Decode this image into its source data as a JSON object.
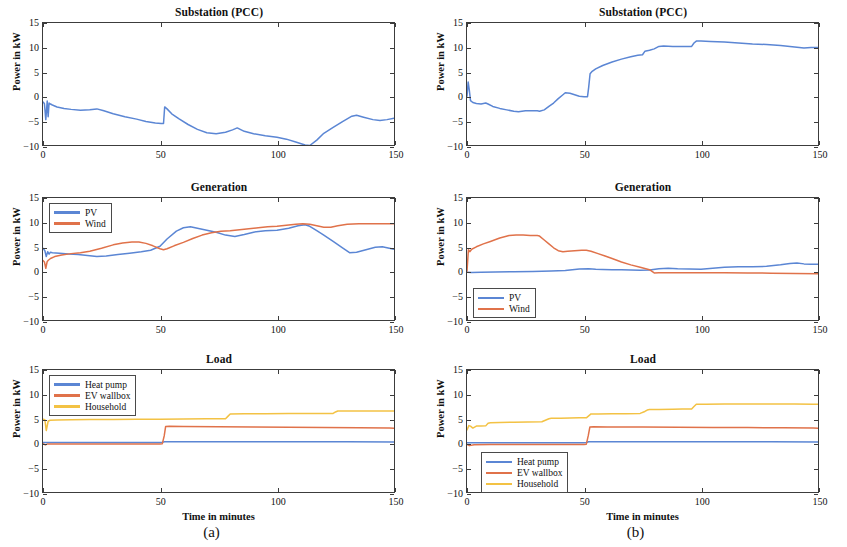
{
  "figure": {
    "width": 847,
    "height": 547,
    "colors": {
      "pv_blue": "#5B86D4",
      "wind_orange": "#E0724A",
      "household_yellow": "#F3C244",
      "axis": "#3c3c3c",
      "text": "#111111"
    },
    "panels": [
      {
        "id": "a",
        "caption": "(a)"
      },
      {
        "id": "b",
        "caption": "(b)"
      }
    ]
  },
  "chart_data": [
    {
      "id": "a-substation",
      "panel": "(a)",
      "type": "line",
      "title": "Substation (PCC)",
      "xlabel": "",
      "ylabel": "Power in kW",
      "xlim": [
        0,
        150
      ],
      "ylim": [
        -10,
        15
      ],
      "xticks": [
        0,
        50,
        100,
        150
      ],
      "yticks": [
        -10,
        -5,
        0,
        5,
        10,
        15
      ],
      "grid": false,
      "legend": null,
      "series": [
        {
          "name": "Substation power",
          "color": "#5B86D4",
          "x": [
            0,
            0.6,
            1.2,
            1.8,
            2.2,
            2.6,
            3.2,
            4,
            6,
            9,
            12,
            16,
            20,
            23,
            26,
            30,
            35,
            40,
            44,
            48,
            50.5,
            51.5,
            52,
            53,
            55,
            58,
            62,
            66,
            70,
            74,
            78,
            81,
            83,
            86,
            90,
            95,
            100,
            104,
            108,
            112,
            114,
            117,
            120,
            124,
            128,
            132,
            134,
            137,
            141,
            144,
            147,
            150
          ],
          "y": [
            -1.2,
            -1.5,
            -4.8,
            -1.0,
            -4.2,
            -1.4,
            -1.6,
            -1.8,
            -2.2,
            -2.5,
            -2.7,
            -2.9,
            -2.8,
            -2.6,
            -3.0,
            -3.6,
            -4.2,
            -4.7,
            -5.2,
            -5.5,
            -5.6,
            -5.6,
            -2.2,
            -2.6,
            -3.6,
            -4.6,
            -5.8,
            -6.8,
            -7.5,
            -7.7,
            -7.4,
            -6.9,
            -6.5,
            -7.2,
            -7.7,
            -8.1,
            -8.4,
            -8.8,
            -9.4,
            -10.0,
            -10.1,
            -9.0,
            -7.6,
            -6.4,
            -5.2,
            -4.1,
            -3.9,
            -4.3,
            -4.8,
            -5.0,
            -4.8,
            -4.5
          ]
        }
      ]
    },
    {
      "id": "a-generation",
      "panel": "(a)",
      "type": "line",
      "title": "Generation",
      "xlabel": "",
      "ylabel": "Power in kW",
      "xlim": [
        0,
        150
      ],
      "ylim": [
        -10,
        15
      ],
      "xticks": [
        0,
        50,
        100,
        150
      ],
      "yticks": [
        -10,
        -5,
        0,
        5,
        10,
        15
      ],
      "grid": false,
      "legend": {
        "position": "north-west",
        "entries": [
          "PV",
          "Wind"
        ]
      },
      "series": [
        {
          "name": "PV",
          "color": "#5B86D4",
          "x": [
            0,
            0.8,
            1.4,
            2,
            2.6,
            3.2,
            4,
            7,
            11,
            15,
            19,
            23,
            27,
            32,
            37,
            42,
            46,
            50,
            53,
            57,
            60,
            63,
            66,
            70,
            74,
            78,
            82,
            86,
            90,
            95,
            100,
            105,
            109,
            112,
            114,
            117,
            120,
            124,
            128,
            131,
            134,
            138,
            142,
            145,
            148,
            150
          ],
          "y": [
            4.7,
            4.2,
            3.0,
            4.0,
            3.5,
            3.9,
            3.8,
            3.7,
            3.5,
            3.4,
            3.2,
            3.0,
            3.1,
            3.4,
            3.7,
            4.0,
            4.3,
            5.1,
            6.6,
            8.2,
            8.9,
            9.1,
            8.8,
            8.4,
            8.0,
            7.4,
            7.1,
            7.5,
            8.0,
            8.3,
            8.4,
            8.8,
            9.3,
            9.5,
            9.2,
            8.3,
            7.4,
            6.1,
            4.8,
            3.8,
            3.9,
            4.4,
            4.9,
            5.0,
            4.7,
            4.5
          ]
        },
        {
          "name": "Wind",
          "color": "#E0724A",
          "x": [
            0,
            0.6,
            1.2,
            1.8,
            2.4,
            3.2,
            5,
            8,
            12,
            16,
            20,
            25,
            30,
            34,
            38,
            41,
            44,
            47,
            50,
            51.5,
            53,
            56,
            60,
            64,
            68,
            72,
            76,
            80,
            84,
            88,
            92,
            96,
            100,
            104,
            108,
            111,
            114,
            117,
            120,
            123,
            126,
            130,
            135,
            140,
            145,
            150
          ],
          "y": [
            2.2,
            1.9,
            0.6,
            2.0,
            2.3,
            2.6,
            3.0,
            3.3,
            3.6,
            3.8,
            4.1,
            4.7,
            5.4,
            5.8,
            6.0,
            6.0,
            5.7,
            5.2,
            4.6,
            4.4,
            4.6,
            5.2,
            5.9,
            6.7,
            7.4,
            7.9,
            8.2,
            8.3,
            8.5,
            8.7,
            8.9,
            9.1,
            9.2,
            9.4,
            9.6,
            9.7,
            9.6,
            9.3,
            9.0,
            9.0,
            9.3,
            9.6,
            9.7,
            9.7,
            9.7,
            9.7
          ]
        }
      ]
    },
    {
      "id": "a-load",
      "panel": "(a)",
      "type": "line",
      "title": "Load",
      "xlabel": "Time in minutes",
      "ylabel": "Power in kW",
      "xlim": [
        0,
        150
      ],
      "ylim": [
        -10,
        15
      ],
      "xticks": [
        0,
        50,
        100,
        150
      ],
      "yticks": [
        -10,
        -5,
        0,
        5,
        10,
        15
      ],
      "grid": false,
      "legend": {
        "position": "north-west",
        "entries": [
          "Heat pump",
          "EV wallbox",
          "Household"
        ]
      },
      "series": [
        {
          "name": "Heat pump",
          "color": "#5B86D4",
          "x": [
            0,
            2,
            5,
            20,
            40,
            50,
            51,
            52,
            55,
            70,
            90,
            110,
            130,
            150
          ],
          "y": [
            0.15,
            0.15,
            0.15,
            0.15,
            0.15,
            0.15,
            0.2,
            0.3,
            0.3,
            0.3,
            0.3,
            0.3,
            0.3,
            0.25
          ]
        },
        {
          "name": "EV wallbox",
          "color": "#E0724A",
          "x": [
            0,
            1,
            2,
            5,
            15,
            30,
            45,
            50,
            51,
            51.8,
            52.4,
            54,
            60,
            75,
            90,
            105,
            120,
            135,
            148,
            150
          ],
          "y": [
            -0.1,
            -0.35,
            -0.15,
            -0.15,
            -0.15,
            -0.15,
            -0.15,
            -0.15,
            -0.1,
            1.5,
            3.4,
            3.45,
            3.4,
            3.35,
            3.3,
            3.25,
            3.2,
            3.15,
            3.1,
            3.05
          ]
        },
        {
          "name": "Household",
          "color": "#F3C244",
          "x": [
            0,
            0.8,
            1.4,
            2.2,
            3,
            6,
            12,
            20,
            30,
            40,
            50,
            60,
            70,
            78,
            79,
            80,
            86,
            95,
            105,
            115,
            124,
            125,
            126,
            132,
            140,
            148,
            150
          ],
          "y": [
            4.9,
            4.8,
            2.6,
            4.5,
            4.7,
            4.75,
            4.8,
            4.85,
            4.85,
            4.9,
            4.9,
            4.95,
            5.0,
            5.0,
            5.5,
            6.0,
            6.05,
            6.05,
            6.1,
            6.1,
            6.1,
            6.4,
            6.6,
            6.6,
            6.6,
            6.6,
            6.6
          ]
        }
      ]
    },
    {
      "id": "b-substation",
      "panel": "(b)",
      "type": "line",
      "title": "Substation (PCC)",
      "xlabel": "",
      "ylabel": "Power in kW",
      "xlim": [
        0,
        150
      ],
      "ylim": [
        -10,
        15
      ],
      "xticks": [
        0,
        50,
        100,
        150
      ],
      "yticks": [
        -10,
        -5,
        0,
        5,
        10,
        15
      ],
      "grid": false,
      "legend": null,
      "series": [
        {
          "name": "Substation power",
          "color": "#5B86D4",
          "x": [
            0,
            0.5,
            1,
            1.5,
            2.5,
            4,
            6,
            8,
            9,
            11,
            14,
            17,
            20,
            22,
            25,
            28,
            30,
            31,
            33,
            35,
            37,
            39,
            41,
            42,
            44,
            46,
            48,
            50,
            51.5,
            52,
            52.6,
            53.5,
            55,
            58,
            62,
            66,
            70,
            73,
            75,
            76,
            78,
            80,
            82,
            84,
            88,
            92,
            96,
            97,
            98,
            100,
            104,
            110,
            116,
            122,
            128,
            134,
            140,
            144,
            147,
            150
          ],
          "y": [
            0.0,
            2.9,
            1.2,
            -0.9,
            -1.3,
            -1.5,
            -1.6,
            -1.4,
            -1.6,
            -2.1,
            -2.5,
            -2.8,
            -3.1,
            -3.2,
            -3.0,
            -3.0,
            -3.0,
            -3.1,
            -2.8,
            -2.1,
            -1.4,
            -0.5,
            0.3,
            0.7,
            0.6,
            0.3,
            0.0,
            -0.1,
            -0.1,
            1.8,
            4.6,
            5.1,
            5.6,
            6.3,
            7.0,
            7.6,
            8.1,
            8.4,
            8.5,
            9.2,
            9.4,
            9.7,
            10.2,
            10.3,
            10.2,
            10.2,
            10.2,
            10.9,
            11.3,
            11.3,
            11.2,
            11.1,
            10.9,
            10.7,
            10.6,
            10.4,
            10.1,
            9.9,
            10.0,
            10.0
          ]
        }
      ]
    },
    {
      "id": "b-generation",
      "panel": "(b)",
      "type": "line",
      "title": "Generation",
      "xlabel": "",
      "ylabel": "Power in kW",
      "xlim": [
        0,
        150
      ],
      "ylim": [
        -10,
        15
      ],
      "xticks": [
        0,
        50,
        100,
        150
      ],
      "yticks": [
        -10,
        -5,
        0,
        5,
        10,
        15
      ],
      "grid": false,
      "legend": {
        "position": "south-west",
        "entries": [
          "PV",
          "Wind"
        ]
      },
      "series": [
        {
          "name": "PV",
          "color": "#5B86D4",
          "x": [
            0,
            2,
            6,
            12,
            20,
            28,
            36,
            42,
            48,
            52,
            55,
            58,
            62,
            66,
            70,
            74,
            78,
            82,
            86,
            90,
            95,
            100,
            105,
            110,
            116,
            122,
            128,
            134,
            138,
            141,
            144,
            147,
            150
          ],
          "y": [
            -0.2,
            -0.25,
            -0.2,
            -0.15,
            -0.1,
            -0.05,
            0.05,
            0.15,
            0.45,
            0.5,
            0.4,
            0.35,
            0.3,
            0.3,
            0.25,
            0.2,
            0.25,
            0.5,
            0.6,
            0.5,
            0.45,
            0.4,
            0.6,
            0.8,
            0.9,
            0.9,
            1.0,
            1.3,
            1.6,
            1.7,
            1.5,
            1.4,
            1.4
          ]
        },
        {
          "name": "Wind",
          "color": "#E0724A",
          "x": [
            0,
            0.6,
            1.2,
            2,
            4,
            7,
            10,
            14,
            18,
            21,
            24,
            27,
            30,
            31,
            33,
            35,
            37,
            39,
            41,
            43,
            46,
            49,
            51,
            53,
            56,
            59,
            62,
            66,
            70,
            74,
            78,
            80,
            82,
            86,
            92,
            100,
            110,
            120,
            130,
            140,
            150
          ],
          "y": [
            0.0,
            4.4,
            4.0,
            4.5,
            5.0,
            5.6,
            6.1,
            6.8,
            7.3,
            7.4,
            7.4,
            7.3,
            7.3,
            7.2,
            6.4,
            5.6,
            4.8,
            4.2,
            4.0,
            4.1,
            4.2,
            4.3,
            4.3,
            4.1,
            3.6,
            3.1,
            2.6,
            1.9,
            1.3,
            0.8,
            0.3,
            -0.35,
            -0.3,
            -0.3,
            -0.3,
            -0.3,
            -0.3,
            -0.35,
            -0.4,
            -0.45,
            -0.5
          ]
        }
      ]
    },
    {
      "id": "b-load",
      "panel": "(b)",
      "type": "line",
      "title": "Load",
      "xlabel": "Time in minutes",
      "ylabel": "Power in kW",
      "xlim": [
        0,
        150
      ],
      "ylim": [
        -10,
        15
      ],
      "xticks": [
        0,
        50,
        100,
        150
      ],
      "yticks": [
        -10,
        -5,
        0,
        5,
        10,
        15
      ],
      "grid": false,
      "legend": {
        "position": "west-low",
        "entries": [
          "Heat pump",
          "EV wallbox",
          "Household"
        ]
      },
      "series": [
        {
          "name": "Heat pump",
          "color": "#5B86D4",
          "x": [
            0,
            5,
            20,
            40,
            50,
            51,
            52,
            55,
            70,
            90,
            110,
            130,
            150
          ],
          "y": [
            0.1,
            0.1,
            0.1,
            0.1,
            0.1,
            0.15,
            0.3,
            0.3,
            0.3,
            0.3,
            0.3,
            0.3,
            0.25
          ]
        },
        {
          "name": "EV wallbox",
          "color": "#E0724A",
          "x": [
            0,
            1,
            3,
            10,
            25,
            40,
            50,
            51,
            51.8,
            52.5,
            54,
            60,
            75,
            90,
            105,
            120,
            135,
            148,
            150
          ],
          "y": [
            -0.25,
            -0.5,
            -0.3,
            -0.25,
            -0.25,
            -0.25,
            -0.25,
            -0.2,
            1.5,
            3.3,
            3.35,
            3.3,
            3.3,
            3.25,
            3.2,
            3.2,
            3.15,
            3.1,
            3.05
          ]
        },
        {
          "name": "Household",
          "color": "#F3C244",
          "x": [
            0,
            0.8,
            1.5,
            2.5,
            4,
            6,
            8,
            9,
            10,
            14,
            20,
            26,
            32,
            34,
            35,
            36,
            40,
            44,
            48,
            51,
            52,
            53,
            56,
            62,
            68,
            74,
            76,
            77,
            78,
            82,
            88,
            92,
            96,
            97,
            98,
            102,
            110,
            120,
            130,
            140,
            148,
            150
          ],
          "y": [
            2.7,
            3.6,
            3.5,
            3.1,
            3.5,
            3.5,
            3.55,
            4.1,
            4.2,
            4.25,
            4.3,
            4.35,
            4.4,
            4.8,
            5.0,
            5.1,
            5.1,
            5.15,
            5.2,
            5.2,
            5.6,
            6.0,
            6.0,
            6.05,
            6.05,
            6.1,
            6.5,
            6.8,
            6.9,
            6.9,
            6.95,
            7.0,
            7.0,
            7.5,
            8.0,
            8.0,
            8.05,
            8.05,
            8.05,
            8.05,
            8.0,
            8.0
          ]
        }
      ]
    }
  ]
}
